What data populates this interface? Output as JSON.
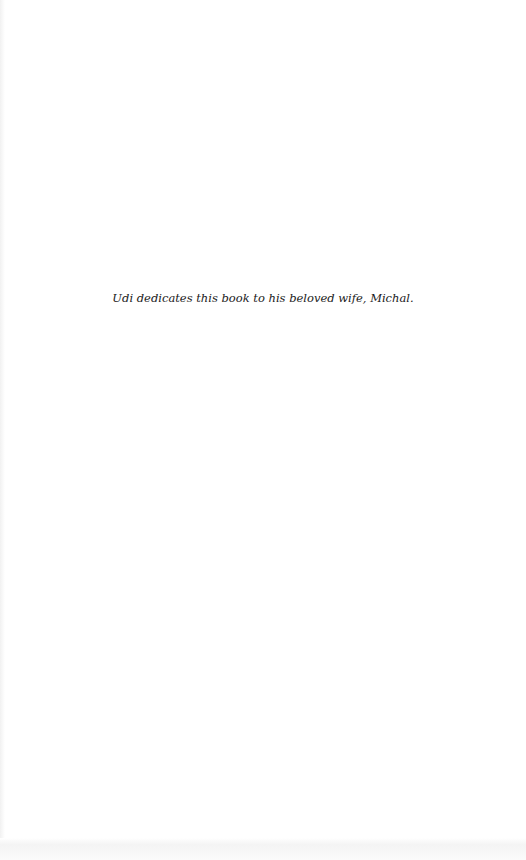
{
  "page": {
    "dedication": "Udi dedicates this book to his beloved wife, Michal."
  }
}
